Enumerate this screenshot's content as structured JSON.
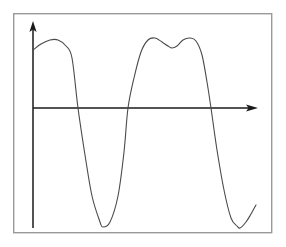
{
  "figure": {
    "title": "",
    "background_color": "#ffffff",
    "frame": {
      "name": "plot-border",
      "x": 13,
      "y": 13,
      "width": 259,
      "height": 220,
      "stroke_color": "#9a9a9a"
    }
  },
  "chart_data": {
    "type": "line",
    "title": "",
    "subtitle": "",
    "xlabel": "",
    "ylabel": "",
    "grid": false,
    "legend": null,
    "axes": {
      "x_axis": {
        "name": "x-axis",
        "orientation": "horizontal",
        "y_pixel": 108,
        "x_start": 33,
        "x_end": 258,
        "arrow": "right",
        "tick_labels": [],
        "color": "#1a1a1a"
      },
      "y_axis": {
        "name": "y-axis",
        "orientation": "vertical",
        "x_pixel": 33,
        "y_start": 228,
        "y_end": 22,
        "arrow": "up",
        "tick_labels": [],
        "color": "#1a1a1a"
      }
    },
    "series": [
      {
        "name": "waveform",
        "color": "#4a4a4a",
        "description": "smooth oscillating curve with a double-humped second crest",
        "x": [
          33,
          41,
          50,
          58,
          66,
          72,
          78,
          85,
          92,
          100,
          103,
          110,
          118,
          124,
          128,
          134,
          141,
          148,
          155,
          162,
          168,
          172,
          177,
          183,
          190,
          196,
          202,
          207,
          211,
          217,
          224,
          231,
          237,
          240,
          246,
          251,
          256
        ],
        "y": [
          50,
          44,
          40,
          40,
          46,
          58,
          108,
          155,
          196,
          222,
          227,
          222,
          196,
          152,
          108,
          78,
          52,
          40,
          38,
          42,
          46,
          48,
          46,
          40,
          38,
          41,
          55,
          82,
          108,
          150,
          190,
          218,
          226,
          228,
          222,
          214,
          205
        ],
        "key_points": {
          "start": {
            "x": 33,
            "y": 50
          },
          "first_crest": {
            "x": 54,
            "y": 39
          },
          "first_zero_crossing": {
            "x": 78,
            "y": 108
          },
          "first_trough": {
            "x": 103,
            "y": 227
          },
          "second_zero_crossing": {
            "x": 128,
            "y": 108
          },
          "left_hump": {
            "x": 156,
            "y": 38
          },
          "central_dip": {
            "x": 172,
            "y": 48
          },
          "right_hump": {
            "x": 190,
            "y": 38
          },
          "third_zero_crossing": {
            "x": 211,
            "y": 108
          },
          "second_trough": {
            "x": 240,
            "y": 228
          },
          "end": {
            "x": 256,
            "y": 205
          }
        }
      }
    ],
    "xlim": [
      33,
      258
    ],
    "ylim": [
      233,
      22
    ]
  }
}
